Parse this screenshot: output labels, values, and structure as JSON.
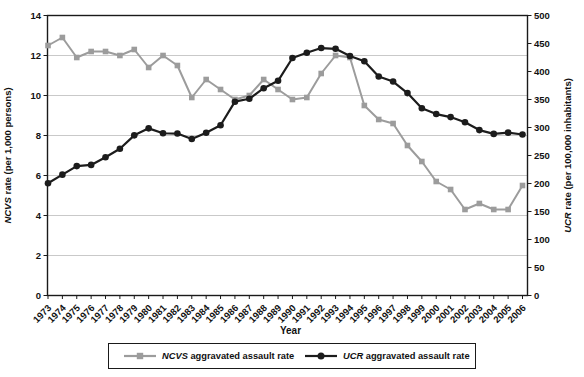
{
  "figure": {
    "left_axis": {
      "abbr": "NCVS",
      "title_rest": " rate  (per 1,000 persons)",
      "ticks": [
        0,
        2,
        4,
        6,
        8,
        10,
        12,
        14
      ]
    },
    "right_axis": {
      "abbr": "UCR",
      "title_rest": " rate  (per 100,000 inhabitants)",
      "ticks": [
        0,
        50,
        100,
        150,
        200,
        250,
        300,
        350,
        400,
        450,
        500
      ]
    },
    "x_axis": {
      "title": "Year"
    },
    "legend": {
      "items": [
        {
          "abbr": "NCVS",
          "label_rest": " aggravated assault rate",
          "marker": "square",
          "color": "#9c9c9c"
        },
        {
          "abbr": "UCR",
          "label_rest": " aggravated assault rate",
          "marker": "circle",
          "color": "#1c1c1c"
        }
      ]
    },
    "colors": {
      "ncvs": "#9c9c9c",
      "ucr": "#1c1c1c",
      "grid": "#c9c9c9",
      "frame": "#1a1a1a",
      "text": "#111111"
    }
  },
  "chart_data": {
    "type": "line",
    "x": [
      1973,
      1974,
      1975,
      1976,
      1977,
      1978,
      1979,
      1980,
      1981,
      1982,
      1983,
      1984,
      1985,
      1986,
      1987,
      1988,
      1989,
      1990,
      1991,
      1992,
      1993,
      1994,
      1995,
      1996,
      1997,
      1998,
      1999,
      2000,
      2001,
      2002,
      2003,
      2004,
      2005,
      2006
    ],
    "series": [
      {
        "name": "NCVS aggravated assault rate",
        "axis": "left",
        "marker": "square",
        "color": "#9c9c9c",
        "values": [
          12.5,
          12.9,
          11.9,
          12.2,
          12.2,
          12.0,
          12.3,
          11.4,
          12.0,
          11.5,
          9.9,
          10.8,
          10.3,
          9.8,
          10.0,
          10.8,
          10.3,
          9.8,
          9.9,
          11.1,
          12.0,
          11.9,
          9.5,
          8.8,
          8.6,
          7.5,
          6.7,
          5.7,
          5.3,
          4.3,
          4.6,
          4.3,
          4.3,
          5.5
        ]
      },
      {
        "name": "UCR aggravated assault rate",
        "axis": "right",
        "marker": "circle",
        "color": "#1c1c1c",
        "values": [
          200.5,
          215.8,
          231.1,
          233.2,
          247.0,
          262.1,
          286.0,
          298.5,
          289.7,
          289.2,
          279.4,
          290.6,
          304.0,
          346.1,
          351.3,
          370.2,
          383.4,
          424.1,
          433.4,
          441.9,
          440.5,
          427.6,
          418.3,
          391.0,
          382.1,
          361.4,
          334.3,
          324.0,
          318.6,
          309.5,
          295.4,
          288.6,
          290.8,
          287.5
        ]
      }
    ],
    "left_ylabel": "NCVS rate (per 1,000 persons)",
    "right_ylabel": "UCR rate (per 100,000 inhabitants)",
    "xlabel": "Year",
    "left_ylim": [
      0,
      14
    ],
    "right_ylim": [
      0,
      500
    ],
    "grid": true,
    "legend_position": "bottom"
  }
}
